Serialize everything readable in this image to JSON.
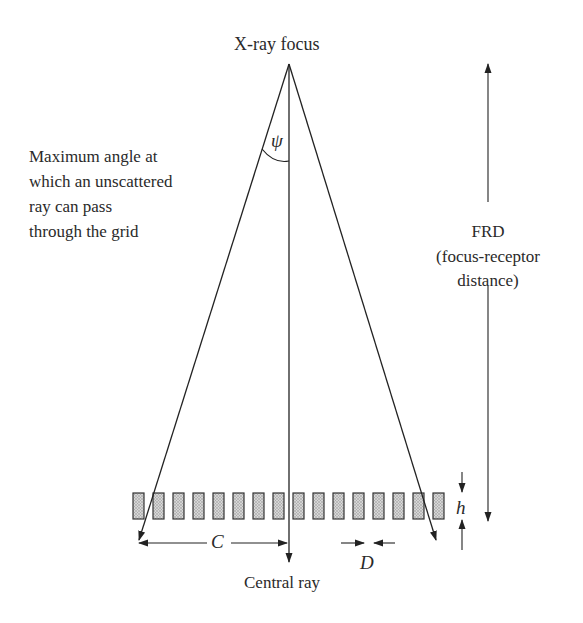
{
  "diagram": {
    "labels": {
      "focus": "X-ray focus",
      "psi": "ψ",
      "max_angle": [
        "Maximum angle at",
        "which an unscattered",
        "ray can pass",
        "through the grid"
      ],
      "frd": [
        "FRD",
        "(focus-receptor",
        "distance)"
      ],
      "h": "h",
      "c": "C",
      "d": "D",
      "central_ray": "Central ray"
    },
    "grid": {
      "strip_count": 16,
      "strip_fill": "#bdbdbd",
      "strip_stroke": "#333333"
    },
    "colors": {
      "line": "#222222",
      "background": "#ffffff"
    }
  }
}
